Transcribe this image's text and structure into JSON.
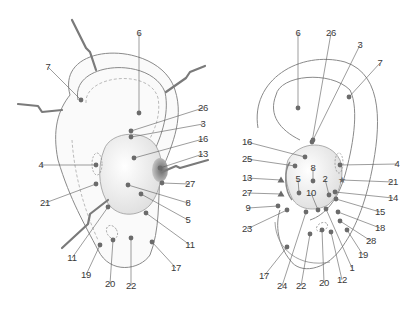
{
  "colors": {
    "outline": "#8a8a8a",
    "point": "#6b6b6b",
    "leader": "#5a5a5a",
    "label": "#3a3a3a",
    "shading": "#e6e6e6",
    "instrument": "#7a7a7a"
  },
  "left_ear": {
    "view": "lateral ear with retractors",
    "labels": [
      {
        "id": "L6",
        "text": "6",
        "x": 139,
        "y": 33,
        "px": 139,
        "py": 113
      },
      {
        "id": "L7",
        "text": "7",
        "x": 48,
        "y": 67,
        "px": 81,
        "py": 100
      },
      {
        "id": "L26",
        "text": "26",
        "x": 203,
        "y": 108,
        "px": 131,
        "py": 131
      },
      {
        "id": "L3",
        "text": "3",
        "x": 203,
        "y": 124,
        "px": 131,
        "py": 137
      },
      {
        "id": "L16",
        "text": "16",
        "x": 203,
        "y": 139,
        "px": 134,
        "py": 158
      },
      {
        "id": "L13",
        "text": "13",
        "x": 203,
        "y": 154,
        "px": 160,
        "py": 168
      },
      {
        "id": "L4",
        "text": "4",
        "x": 41,
        "y": 165,
        "px": 96,
        "py": 165
      },
      {
        "id": "L27",
        "text": "27",
        "x": 190,
        "y": 184,
        "px": 162,
        "py": 183
      },
      {
        "id": "L21",
        "text": "21",
        "x": 45,
        "y": 203,
        "px": 96,
        "py": 184
      },
      {
        "id": "L8",
        "text": "8",
        "x": 188,
        "y": 203,
        "px": 128,
        "py": 185
      },
      {
        "id": "L5",
        "text": "5",
        "x": 188,
        "y": 220,
        "px": 141,
        "py": 194
      },
      {
        "id": "L11a",
        "text": "11",
        "x": 72,
        "y": 258,
        "px": 108,
        "py": 207
      },
      {
        "id": "L11b",
        "text": "11",
        "x": 190,
        "y": 245,
        "px": 146,
        "py": 213
      },
      {
        "id": "L19",
        "text": "19",
        "x": 86,
        "y": 275,
        "px": 100,
        "py": 245
      },
      {
        "id": "L20",
        "text": "20",
        "x": 110,
        "y": 284,
        "px": 113,
        "py": 240
      },
      {
        "id": "L22",
        "text": "22",
        "x": 131,
        "y": 286,
        "px": 131,
        "py": 238
      },
      {
        "id": "L17",
        "text": "17",
        "x": 176,
        "y": 268,
        "px": 152,
        "py": 242
      }
    ]
  },
  "right_ear": {
    "view": "lateral ear point map",
    "labels": [
      {
        "id": "R6",
        "text": "6",
        "x": 298,
        "y": 33,
        "px": 298,
        "py": 108
      },
      {
        "id": "R26",
        "text": "26",
        "x": 331,
        "y": 33,
        "px": 312,
        "py": 142
      },
      {
        "id": "R3",
        "text": "3",
        "x": 360,
        "y": 45,
        "px": 313,
        "py": 140
      },
      {
        "id": "R7",
        "text": "7",
        "x": 380,
        "y": 63,
        "px": 349,
        "py": 97
      },
      {
        "id": "R16",
        "text": "16",
        "x": 247,
        "y": 142,
        "px": 305,
        "py": 157
      },
      {
        "id": "R25",
        "text": "25",
        "x": 247,
        "y": 159,
        "px": 295,
        "py": 166
      },
      {
        "id": "R8",
        "text": "8",
        "x": 313,
        "y": 168,
        "px": 313,
        "py": 181
      },
      {
        "id": "R4",
        "text": "4",
        "x": 397,
        "y": 164,
        "px": 340,
        "py": 165
      },
      {
        "id": "R13",
        "text": "13",
        "x": 247,
        "y": 178,
        "px": 281,
        "py": 180,
        "marker": "triangle"
      },
      {
        "id": "R5",
        "text": "5",
        "x": 298,
        "y": 179,
        "px": 299,
        "py": 193
      },
      {
        "id": "R2",
        "text": "2",
        "x": 325,
        "y": 179,
        "px": 329,
        "py": 195
      },
      {
        "id": "R21",
        "text": "21",
        "x": 393,
        "y": 182,
        "px": 342,
        "py": 180,
        "marker": "star"
      },
      {
        "id": "R10",
        "text": "10",
        "x": 311,
        "y": 193,
        "px": 318,
        "py": 210
      },
      {
        "id": "R27",
        "text": "27",
        "x": 247,
        "y": 193,
        "px": 281,
        "py": 194,
        "marker": "triangle"
      },
      {
        "id": "R14",
        "text": "14",
        "x": 393,
        "y": 198,
        "px": 335,
        "py": 192
      },
      {
        "id": "R9",
        "text": "9",
        "x": 248,
        "y": 208,
        "px": 278,
        "py": 206
      },
      {
        "id": "R15",
        "text": "15",
        "x": 380,
        "y": 212,
        "px": 336,
        "py": 199
      },
      {
        "id": "R23",
        "text": "23",
        "x": 247,
        "y": 229,
        "px": 287,
        "py": 210
      },
      {
        "id": "R18",
        "text": "18",
        "x": 380,
        "y": 228,
        "px": 338,
        "py": 212
      },
      {
        "id": "R28",
        "text": "28",
        "x": 371,
        "y": 241,
        "px": 340,
        "py": 221
      },
      {
        "id": "R19",
        "text": "19",
        "x": 363,
        "y": 255,
        "px": 347,
        "py": 230
      },
      {
        "id": "R1",
        "text": "1",
        "x": 352,
        "y": 268,
        "px": 326,
        "py": 209
      },
      {
        "id": "R17",
        "text": "17",
        "x": 264,
        "y": 276,
        "px": 287,
        "py": 247
      },
      {
        "id": "R12",
        "text": "12",
        "x": 342,
        "y": 280,
        "px": 331,
        "py": 232
      },
      {
        "id": "R24",
        "text": "24",
        "x": 282,
        "y": 286,
        "px": 306,
        "py": 212
      },
      {
        "id": "R22",
        "text": "22",
        "x": 301,
        "y": 286,
        "px": 310,
        "py": 234
      },
      {
        "id": "R20",
        "text": "20",
        "x": 324,
        "y": 283,
        "px": 322,
        "py": 230
      }
    ]
  }
}
